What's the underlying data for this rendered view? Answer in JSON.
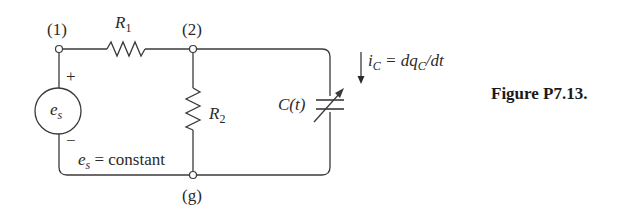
{
  "diagram": {
    "type": "circuit",
    "nodes": [
      {
        "id": "1",
        "label": "(1)"
      },
      {
        "id": "2",
        "label": "(2)"
      },
      {
        "id": "g",
        "label": "(g)"
      }
    ],
    "components": {
      "r1": {
        "symbol": "R",
        "subscript": "1"
      },
      "r2": {
        "symbol": "R",
        "subscript": "2"
      },
      "source": {
        "symbol": "e",
        "subscript": "s",
        "plus": "+",
        "minus": "−"
      },
      "capacitor": {
        "label": "C(t)"
      }
    },
    "annotations": {
      "source_note_symbol": "e",
      "source_note_subscript": "s",
      "source_note_text": " = constant",
      "current_i": "i",
      "current_i_sub": "C",
      "current_eq": " = dq",
      "current_q_sub": "C",
      "current_tail": "/dt"
    },
    "figure_caption": "Figure P7.13."
  }
}
